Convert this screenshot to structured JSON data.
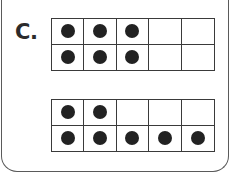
{
  "problem": {
    "label": "C.",
    "ten_frames": [
      {
        "id": "top",
        "rows": 2,
        "cols": 5,
        "cells": [
          [
            1,
            1,
            1,
            0,
            0
          ],
          [
            1,
            1,
            1,
            0,
            0
          ]
        ],
        "filled_count": 6
      },
      {
        "id": "bottom",
        "rows": 2,
        "cols": 5,
        "cells": [
          [
            1,
            1,
            0,
            0,
            0
          ],
          [
            1,
            1,
            1,
            1,
            1
          ]
        ],
        "filled_count": 7
      }
    ]
  },
  "colors": {
    "dot": "#222222",
    "grid_line": "#3a3a3a",
    "frame": "#5a5a5a"
  }
}
